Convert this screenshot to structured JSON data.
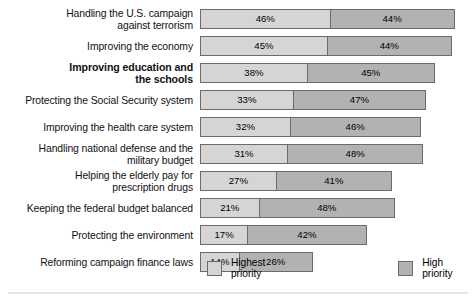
{
  "chart_data": {
    "type": "bar",
    "orientation": "horizontal",
    "stacked": true,
    "title": "",
    "subtitle": "",
    "xlabel": "",
    "ylabel": "",
    "grid": false,
    "legend_position": "bottom",
    "xlim": [
      0,
      100
    ],
    "unit": "%",
    "categories": [
      "Handling the U.S. campaign\nagainst terrorism",
      "Improving the economy",
      "Improving education and\nthe schools",
      "Protecting the Social Security system",
      "Improving the health care system",
      "Handling national defense and the\nmilitary budget",
      "Helping the elderly pay for\nprescription drugs",
      "Keeping the federal budget balanced",
      "Protecting the environment",
      "Reforming campaign finance laws"
    ],
    "series": [
      {
        "name": "Highest priority",
        "color": "#d5d5d5",
        "values": [
          46,
          45,
          38,
          33,
          32,
          31,
          27,
          21,
          17,
          14
        ],
        "labels": [
          "46%",
          "45%",
          "38%",
          "33%",
          "32%",
          "31%",
          "27%",
          "21%",
          "17%",
          "14%"
        ]
      },
      {
        "name": "High priority",
        "color": "#b2b2b2",
        "values": [
          44,
          44,
          45,
          47,
          46,
          48,
          41,
          48,
          42,
          26
        ],
        "labels": [
          "44%",
          "44%",
          "45%",
          "47%",
          "46%",
          "48%",
          "41%",
          "48%",
          "42%",
          "26%"
        ]
      }
    ],
    "emphasized_category_index": 2
  },
  "legend": {
    "items": [
      {
        "label": "Highest priority",
        "swatch": "light"
      },
      {
        "label": "High priority",
        "swatch": "dark"
      }
    ]
  }
}
